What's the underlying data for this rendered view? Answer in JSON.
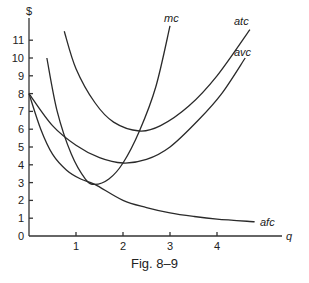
{
  "caption": "Fig. 8–9",
  "chart_data": {
    "type": "line",
    "title": "",
    "xlabel": "q",
    "ylabel": "$",
    "xlim": [
      0,
      5.3
    ],
    "ylim": [
      0,
      12
    ],
    "x_ticks": [
      1,
      2,
      3,
      4
    ],
    "y_ticks": [
      0,
      1,
      2,
      3,
      4,
      5,
      6,
      7,
      8,
      9,
      10,
      11
    ],
    "grid": false,
    "legend": "inline labels at curve ends",
    "series": [
      {
        "name": "mc",
        "points": [
          [
            0.38,
            10.0
          ],
          [
            0.6,
            7.0
          ],
          [
            0.9,
            4.6
          ],
          [
            1.2,
            3.2
          ],
          [
            1.4,
            2.9
          ],
          [
            1.7,
            3.2
          ],
          [
            2.0,
            4.1
          ],
          [
            2.35,
            5.9
          ],
          [
            2.7,
            8.4
          ],
          [
            3.0,
            11.8
          ]
        ]
      },
      {
        "name": "atc",
        "points": [
          [
            0.75,
            11.5
          ],
          [
            1.0,
            9.4
          ],
          [
            1.4,
            7.5
          ],
          [
            1.8,
            6.4
          ],
          [
            2.35,
            5.9
          ],
          [
            2.8,
            6.2
          ],
          [
            3.4,
            7.3
          ],
          [
            4.0,
            9.0
          ],
          [
            4.7,
            11.6
          ]
        ]
      },
      {
        "name": "avc",
        "points": [
          [
            0.0,
            8.0
          ],
          [
            0.5,
            6.2
          ],
          [
            1.0,
            5.1
          ],
          [
            1.5,
            4.4
          ],
          [
            2.0,
            4.1
          ],
          [
            2.5,
            4.3
          ],
          [
            3.0,
            5.0
          ],
          [
            3.6,
            6.5
          ],
          [
            4.1,
            8.0
          ],
          [
            4.6,
            10.0
          ]
        ]
      },
      {
        "name": "afc",
        "points": [
          [
            0.0,
            8.0
          ],
          [
            0.25,
            6.0
          ],
          [
            0.5,
            4.6
          ],
          [
            0.8,
            3.7
          ],
          [
            1.1,
            3.2
          ],
          [
            1.4,
            2.9
          ],
          [
            2.0,
            2.0
          ],
          [
            2.5,
            1.6
          ],
          [
            3.0,
            1.3
          ],
          [
            3.5,
            1.1
          ],
          [
            4.0,
            0.95
          ],
          [
            4.8,
            0.8
          ]
        ]
      }
    ],
    "annotations": [
      "mc",
      "atc",
      "avc",
      "afc"
    ]
  }
}
